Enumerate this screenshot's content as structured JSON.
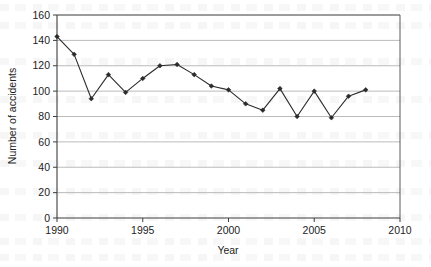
{
  "chart_data": {
    "type": "line",
    "title": "",
    "xlabel": "Year",
    "ylabel": "Number of accidents",
    "xlim": [
      1990,
      2010
    ],
    "ylim": [
      0,
      160
    ],
    "xticks": [
      1990,
      1995,
      2000,
      2005,
      2010
    ],
    "yticks": [
      0,
      20,
      40,
      60,
      80,
      100,
      120,
      140,
      160
    ],
    "grid": "horizontal",
    "legend": "none",
    "marker": "diamond",
    "series_color": "#2b2b2b",
    "grid_color": "#b3b3b3",
    "axis_color": "#4d4d4d",
    "x": [
      1990,
      1991,
      1992,
      1993,
      1994,
      1995,
      1996,
      1997,
      1998,
      1999,
      2000,
      2001,
      2002,
      2003,
      2004,
      2005,
      2006,
      2007,
      2008
    ],
    "values": [
      143,
      129,
      94,
      113,
      99,
      110,
      120,
      121,
      113,
      104,
      101,
      90,
      85,
      102,
      80,
      100,
      79,
      96,
      101
    ],
    "series": [
      {
        "name": "Number of accidents",
        "values": [
          143,
          129,
          94,
          113,
          99,
          110,
          120,
          121,
          113,
          104,
          101,
          90,
          85,
          102,
          80,
          100,
          79,
          96,
          101
        ]
      }
    ]
  }
}
